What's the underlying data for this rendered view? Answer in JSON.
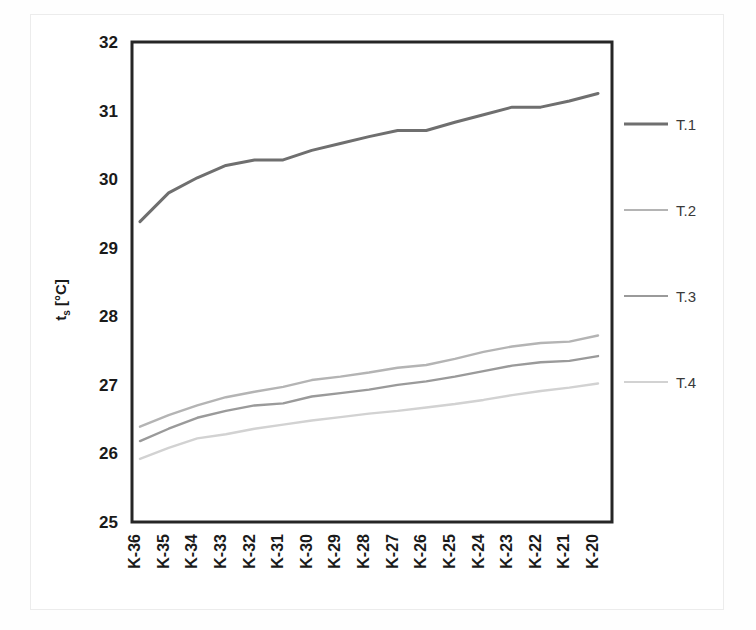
{
  "chart_data": {
    "type": "line",
    "title": "",
    "xlabel": "",
    "ylabel": "tₛ [°C]",
    "ylabel_base": "t",
    "ylabel_sub": "s",
    "ylabel_unit": " [°C]",
    "ylim": [
      25,
      32
    ],
    "yticks": [
      25,
      26,
      27,
      28,
      29,
      30,
      31,
      32
    ],
    "ytick_labels": [
      "25",
      "26",
      "27",
      "28",
      "29",
      "30",
      "31",
      "32"
    ],
    "grid": false,
    "legend_position": "right",
    "categories": [
      "K-36",
      "K-35",
      "K-34",
      "K-33",
      "K-32",
      "K-31",
      "K-30",
      "K-29",
      "K-28",
      "K-27",
      "K-26",
      "K-25",
      "K-24",
      "K-23",
      "K-22",
      "K-21",
      "K-20"
    ],
    "series": [
      {
        "name": "T.1",
        "color": "#6f6f6f",
        "width": 3.0,
        "values": [
          29.38,
          29.8,
          30.02,
          30.2,
          30.28,
          30.28,
          30.42,
          30.52,
          30.62,
          30.71,
          30.71,
          30.83,
          30.94,
          31.05,
          31.05,
          31.14,
          31.25
        ]
      },
      {
        "name": "T.2",
        "color": "#b4b4b4",
        "width": 2.4,
        "values": [
          26.39,
          26.56,
          26.7,
          26.82,
          26.9,
          26.97,
          27.07,
          27.12,
          27.18,
          27.25,
          27.29,
          27.38,
          27.48,
          27.56,
          27.61,
          27.63,
          27.72
        ]
      },
      {
        "name": "T.3",
        "color": "#9a9a9a",
        "width": 2.4,
        "values": [
          26.18,
          26.36,
          26.52,
          26.62,
          26.7,
          26.73,
          26.83,
          26.88,
          26.93,
          27.0,
          27.05,
          27.12,
          27.2,
          27.28,
          27.33,
          27.35,
          27.42
        ]
      },
      {
        "name": "T.4",
        "color": "#d2d2d2",
        "width": 2.4,
        "values": [
          25.92,
          26.08,
          26.22,
          26.28,
          26.36,
          26.42,
          26.48,
          26.53,
          26.58,
          26.62,
          26.67,
          26.72,
          26.78,
          26.85,
          26.91,
          26.96,
          27.02
        ]
      }
    ]
  },
  "legend": {
    "items": [
      {
        "label": "T.1",
        "color": "#6f6f6f"
      },
      {
        "label": "T.2",
        "color": "#b4b4b4"
      },
      {
        "label": "T.3",
        "color": "#9a9a9a"
      },
      {
        "label": "T.4",
        "color": "#d2d2d2"
      }
    ]
  },
  "axes": {
    "y_title_main": "t",
    "y_title_sub": "s",
    "y_title_unit": "[°C]"
  },
  "colors": {
    "axis": "#262626",
    "text": "#1a1a1a",
    "background": "#ffffff",
    "frame": "#ececec"
  }
}
